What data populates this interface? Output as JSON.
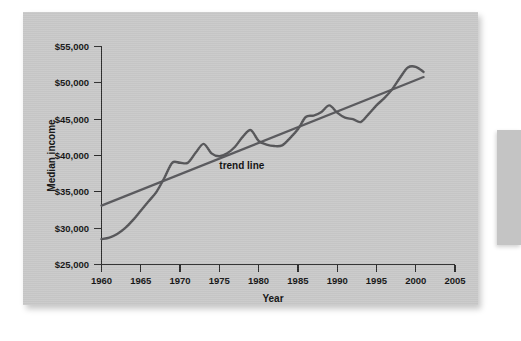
{
  "figure": {
    "background_color": "#c9c9c9",
    "page_color": "#ffffff"
  },
  "chart_data": {
    "type": "line",
    "title": "",
    "xlabel": "Year",
    "ylabel": "Median income",
    "xlim": [
      1960,
      2005
    ],
    "ylim": [
      25000,
      55000
    ],
    "xticks": [
      1960,
      1965,
      1970,
      1975,
      1980,
      1985,
      1990,
      1995,
      2000,
      2005
    ],
    "xtick_labels": [
      "1960",
      "1965",
      "1970",
      "1975",
      "1980",
      "1985",
      "1990",
      "1995",
      "2000",
      "2005"
    ],
    "yticks": [
      25000,
      30000,
      35000,
      40000,
      45000,
      50000,
      55000
    ],
    "ytick_labels": [
      "$25,000",
      "$30,000",
      "$35,000",
      "$40,000",
      "$45,000",
      "$50,000",
      "$55,000"
    ],
    "grid": false,
    "legend": false,
    "line_color": "#555558",
    "trend_color": "#58585c",
    "annotations": [
      {
        "text": "trend line",
        "x": 1975.0,
        "y": 38150
      }
    ],
    "series": [
      {
        "name": "Median income",
        "x": [
          1960,
          1961,
          1962,
          1963,
          1964,
          1965,
          1966,
          1967,
          1968,
          1969,
          1970,
          1971,
          1972,
          1973,
          1974,
          1975,
          1976,
          1977,
          1978,
          1979,
          1980,
          1981,
          1982,
          1983,
          1984,
          1985,
          1986,
          1987,
          1988,
          1989,
          1990,
          1991,
          1992,
          1993,
          1994,
          1995,
          1996,
          1997,
          1998,
          1999,
          2000,
          2001
        ],
        "values": [
          28500,
          28700,
          29200,
          30000,
          31100,
          32400,
          33700,
          35000,
          36900,
          39000,
          39000,
          39000,
          40400,
          41600,
          40300,
          39900,
          40300,
          41200,
          42600,
          43500,
          42000,
          41500,
          41300,
          41400,
          42400,
          43600,
          45300,
          45500,
          46000,
          46900,
          45900,
          45200,
          45000,
          44600,
          45700,
          46900,
          47900,
          49100,
          50700,
          52100,
          52200,
          51500
        ]
      },
      {
        "name": "Trend line",
        "x": [
          1960,
          2001
        ],
        "values": [
          33100,
          50800
        ]
      }
    ]
  },
  "axes": {
    "y_axis_title": "Median income",
    "x_axis_title": "Year"
  },
  "annotation": {
    "trend_label": "trend line"
  }
}
